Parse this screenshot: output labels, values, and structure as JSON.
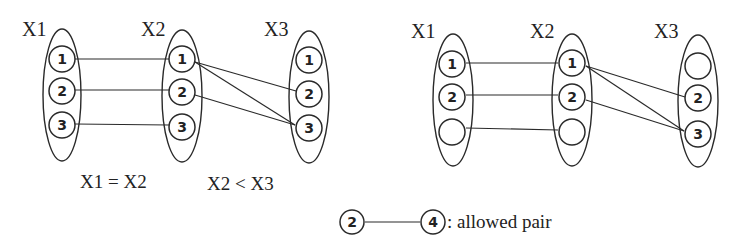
{
  "left_diagram": {
    "variables": [
      {
        "name": "X1",
        "values": [
          "1",
          "2",
          "3"
        ]
      },
      {
        "name": "X2",
        "values": [
          "1",
          "2",
          "3"
        ]
      },
      {
        "name": "X3",
        "values": [
          "1",
          "2",
          "3"
        ]
      }
    ],
    "constraints": [
      "X1 = X2",
      "X2 < X3"
    ],
    "edges": [
      {
        "from": "X1.1",
        "to": "X2.1"
      },
      {
        "from": "X1.2",
        "to": "X2.2"
      },
      {
        "from": "X1.3",
        "to": "X2.3"
      },
      {
        "from": "X2.1",
        "to": "X3.2"
      },
      {
        "from": "X2.1",
        "to": "X3.3"
      },
      {
        "from": "X2.2",
        "to": "X3.3"
      }
    ]
  },
  "right_diagram": {
    "variables": [
      {
        "name": "X1",
        "values": [
          "1",
          "2",
          ""
        ]
      },
      {
        "name": "X2",
        "values": [
          "1",
          "2",
          ""
        ]
      },
      {
        "name": "X3",
        "values": [
          "",
          "2",
          "3"
        ]
      }
    ],
    "edges": [
      {
        "from": "X1.1",
        "to": "X2.1"
      },
      {
        "from": "X1.2",
        "to": "X2.2"
      },
      {
        "from": "X1.3",
        "to": "X2.3"
      },
      {
        "from": "X2.1",
        "to": "X3.2"
      },
      {
        "from": "X2.1",
        "to": "X3.3"
      },
      {
        "from": "X2.2",
        "to": "X3.3"
      }
    ]
  },
  "legend": {
    "left_node": "2",
    "right_node": "4",
    "text": ": allowed pair"
  },
  "colors": {
    "stroke": "#2a2a2a",
    "background": "#ffffff"
  }
}
